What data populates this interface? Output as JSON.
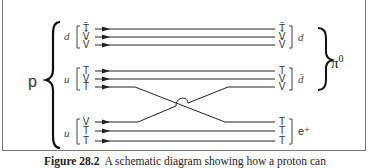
{
  "diagram": {
    "proton_label": "p",
    "pion_label": "π",
    "pion_superscript": "0",
    "positron_label": "e⁺",
    "left_groups": [
      {
        "quark": "d",
        "rishons": [
          "T̄",
          "V̄",
          "V̄"
        ]
      },
      {
        "quark": "u",
        "rishons": [
          "T",
          "V",
          "T"
        ]
      },
      {
        "quark": "u",
        "rishons": [
          "V",
          "T",
          "T"
        ]
      }
    ],
    "right_groups": [
      {
        "label": "d",
        "rishons": [
          "T̄",
          "V̄",
          "V̄"
        ]
      },
      {
        "label": "d̄",
        "rishons": [
          "T",
          "V",
          "V"
        ]
      },
      {
        "label": "e⁺",
        "rishons": [
          "T",
          "T",
          "T"
        ]
      }
    ],
    "crossing": "Middle-group T line crosses to bottom-right T; bottom-group V line crosses to middle-right V (with hump at crossing)"
  },
  "caption": {
    "figure_number": "Figure 28.2",
    "text": "A schematic diagram showing how a proton can"
  }
}
